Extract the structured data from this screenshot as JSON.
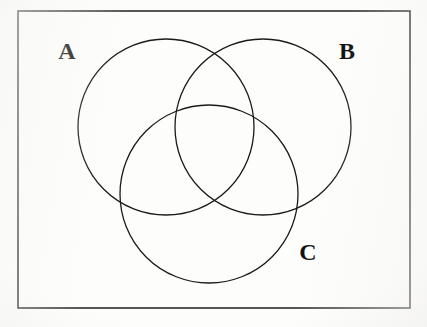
{
  "figure": {
    "kind": "venn-diagram",
    "background_color": "#fdfdfc",
    "ink_color": "#1a1a1a",
    "canvas": {
      "width": 427,
      "height": 327
    }
  },
  "frame": {
    "name": "universal-set-rectangle",
    "x": 18,
    "y": 11,
    "width": 392,
    "height": 297,
    "stroke_color": "#2b2b2b",
    "stroke_width": 1.6
  },
  "circles": [
    {
      "id": "A",
      "label": "A",
      "cx": 166,
      "cy": 127,
      "r": 88,
      "stroke_color": "#1a1a1a",
      "stroke_width": 1.3
    },
    {
      "id": "B",
      "label": "B",
      "cx": 263,
      "cy": 127,
      "r": 88,
      "stroke_color": "#1a1a1a",
      "stroke_width": 1.3
    },
    {
      "id": "C",
      "label": "C",
      "cx": 209,
      "cy": 194,
      "r": 89,
      "stroke_color": "#1a1a1a",
      "stroke_width": 1.3
    }
  ],
  "labels": [
    {
      "id": "label-A",
      "text": "A",
      "x": 67,
      "y": 53,
      "font_size": 24
    },
    {
      "id": "label-B",
      "text": "B",
      "x": 347,
      "y": 53,
      "font_size": 24
    },
    {
      "id": "label-C",
      "text": "C",
      "x": 308,
      "y": 254,
      "font_size": 24
    }
  ]
}
